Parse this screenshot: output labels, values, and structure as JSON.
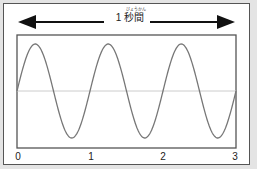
{
  "diagram": {
    "duration_label": "1 秒間",
    "furigana": "びょうかん",
    "x_ticks": [
      "0",
      "1",
      "2",
      "3"
    ],
    "cycles": 3,
    "colors": {
      "wave": "#777777",
      "frame": "#555555",
      "midline": "#cccccc",
      "arrow": "#111111",
      "background": "#e4e4e4"
    }
  }
}
